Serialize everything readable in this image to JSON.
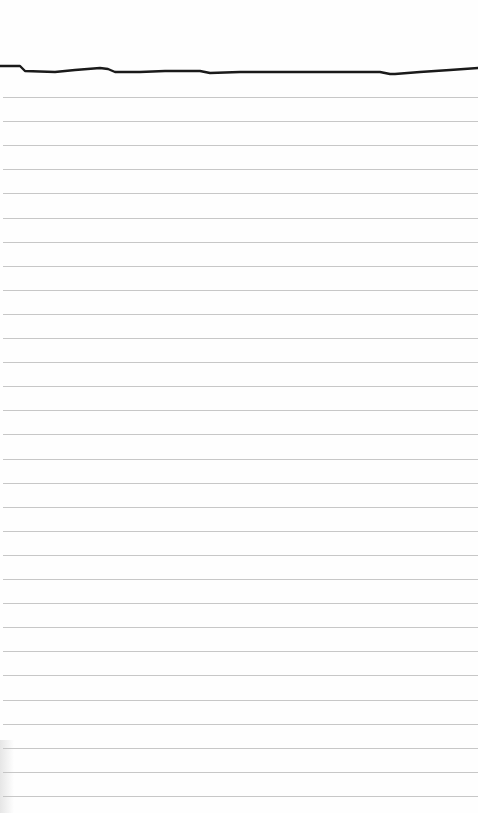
{
  "page": {
    "type": "ruled-notepad-sheet",
    "background_color": "#fefefe",
    "text_content": []
  },
  "top_stroke": {
    "color": "#1a1a1a",
    "stroke_width": 2.4,
    "description": "hand-drawn wavy line across top"
  },
  "rules": {
    "color": "#bdbdbd",
    "count": 30,
    "first_y": 97,
    "spacing": 24.1
  }
}
